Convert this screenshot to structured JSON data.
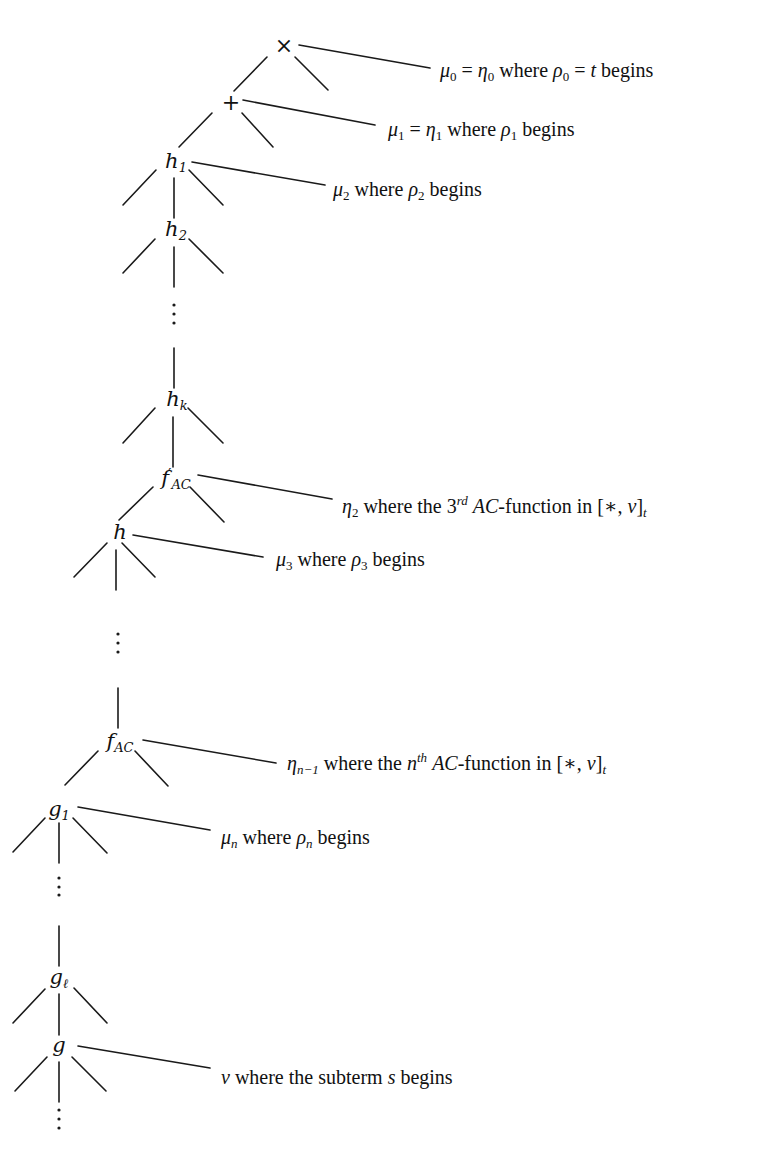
{
  "diagram": {
    "type": "term-tree-with-position-annotations",
    "nodes": [
      {
        "id": "times",
        "symbol": "×",
        "x": 284,
        "y": 46
      },
      {
        "id": "plus",
        "symbol": "+",
        "x": 231,
        "y": 103
      },
      {
        "id": "h1",
        "base": "h",
        "sub": "1",
        "x": 176,
        "y": 162
      },
      {
        "id": "h2",
        "base": "h",
        "sub": "2",
        "x": 176,
        "y": 230
      },
      {
        "id": "hk",
        "base": "h",
        "sub": "k",
        "x": 177,
        "y": 400
      },
      {
        "id": "f_prime_ac",
        "base": "f",
        "prime": "′",
        "sub": "AC",
        "x": 176,
        "y": 479
      },
      {
        "id": "h",
        "base": "h",
        "x": 120,
        "y": 532
      },
      {
        "id": "f_ac",
        "base": "f",
        "sub": "AC",
        "x": 120,
        "y": 742
      },
      {
        "id": "g1",
        "base": "g",
        "sub": "1",
        "x": 59,
        "y": 810
      },
      {
        "id": "g_l",
        "base": "g",
        "sub": "ℓ",
        "x": 59,
        "y": 978
      },
      {
        "id": "g",
        "base": "g",
        "x": 59,
        "y": 1045
      }
    ],
    "annotations": [
      {
        "id": "mu0",
        "parts": [
          {
            "t": "μ",
            "m": true
          },
          {
            "sub": "0"
          },
          {
            "t": " = "
          },
          {
            "t": "η",
            "m": true
          },
          {
            "sub": "0"
          },
          {
            "t": " where "
          },
          {
            "t": "ρ",
            "m": true
          },
          {
            "sub": "0"
          },
          {
            "t": " = "
          },
          {
            "t": "t",
            "m": true
          },
          {
            "t": " begins"
          }
        ],
        "text": "μ0 = η0 where ρ0 = t begins",
        "x": 440,
        "y": 60
      },
      {
        "id": "mu1",
        "parts": [
          {
            "t": "μ",
            "m": true
          },
          {
            "sub": "1"
          },
          {
            "t": " = "
          },
          {
            "t": "η",
            "m": true
          },
          {
            "sub": "1"
          },
          {
            "t": " where "
          },
          {
            "t": "ρ",
            "m": true
          },
          {
            "sub": "1"
          },
          {
            "t": " begins"
          }
        ],
        "text": "μ1 = η1 where ρ1 begins",
        "x": 388,
        "y": 119
      },
      {
        "id": "mu2",
        "parts": [
          {
            "t": "μ",
            "m": true
          },
          {
            "sub": "2"
          },
          {
            "t": " where "
          },
          {
            "t": "ρ",
            "m": true
          },
          {
            "sub": "2"
          },
          {
            "t": " begins"
          }
        ],
        "text": "μ2 where ρ2 begins",
        "x": 333,
        "y": 179
      },
      {
        "id": "eta2",
        "parts": [
          {
            "t": "η",
            "m": true
          },
          {
            "sub": "2"
          },
          {
            "t": " where the 3"
          },
          {
            "sup": "rd"
          },
          {
            "t": " "
          },
          {
            "t": "AC",
            "m": true
          },
          {
            "t": "-function in [∗, "
          },
          {
            "t": "ν",
            "m": true
          },
          {
            "t": "]"
          },
          {
            "sub": "t",
            "m": true
          }
        ],
        "text": "η2 where the 3rd AC-function in [∗,ν]t",
        "x": 342,
        "y": 494
      },
      {
        "id": "mu3",
        "parts": [
          {
            "t": "μ",
            "m": true
          },
          {
            "sub": "3"
          },
          {
            "t": " where "
          },
          {
            "t": "ρ",
            "m": true
          },
          {
            "sub": "3"
          },
          {
            "t": " begins"
          }
        ],
        "text": "μ3 where ρ3 begins",
        "x": 276,
        "y": 549
      },
      {
        "id": "eta_n_minus_1",
        "parts": [
          {
            "t": "η",
            "m": true
          },
          {
            "sub": "n−1",
            "m": true
          },
          {
            "t": " where the "
          },
          {
            "t": "n",
            "m": true
          },
          {
            "sup": "th"
          },
          {
            "t": " "
          },
          {
            "t": "AC",
            "m": true
          },
          {
            "t": "-function in [∗, "
          },
          {
            "t": "ν",
            "m": true
          },
          {
            "t": "]"
          },
          {
            "sub": "t",
            "m": true
          }
        ],
        "text": "ηn−1 where the nth AC-function in [∗,ν]t",
        "x": 287,
        "y": 751
      },
      {
        "id": "mu_n",
        "parts": [
          {
            "t": "μ",
            "m": true
          },
          {
            "sub": "n",
            "m": true
          },
          {
            "t": " where "
          },
          {
            "t": "ρ",
            "m": true
          },
          {
            "sub": "n",
            "m": true
          },
          {
            "t": " begins"
          }
        ],
        "text": "μn where ρn begins",
        "x": 221,
        "y": 827
      },
      {
        "id": "nu",
        "parts": [
          {
            "t": "ν",
            "m": true
          },
          {
            "t": " where the subterm "
          },
          {
            "t": "s",
            "m": true
          },
          {
            "t": " begins"
          }
        ],
        "text": "ν where the subterm s begins",
        "x": 221,
        "y": 1067
      }
    ],
    "edges": [
      [
        267,
        57,
        234,
        91
      ],
      [
        295,
        57,
        328,
        90
      ],
      [
        212,
        113,
        179,
        147
      ],
      [
        242,
        113,
        273,
        147
      ],
      [
        156,
        170,
        123,
        205
      ],
      [
        189,
        170,
        223,
        205
      ],
      [
        174,
        178,
        174,
        218
      ],
      [
        155,
        239,
        123,
        273
      ],
      [
        189,
        239,
        223,
        273
      ],
      [
        174,
        247,
        174,
        287
      ],
      [
        174,
        348,
        174,
        388
      ],
      [
        155,
        408,
        123,
        443
      ],
      [
        188,
        408,
        223,
        443
      ],
      [
        173,
        417,
        173,
        467
      ],
      [
        153,
        487,
        119,
        520
      ],
      [
        190,
        487,
        224,
        522
      ],
      [
        107,
        543,
        74,
        577
      ],
      [
        122,
        543,
        155,
        577
      ],
      [
        116,
        550,
        116,
        590
      ],
      [
        118,
        688,
        118,
        728
      ],
      [
        98,
        751,
        65,
        785
      ],
      [
        135,
        751,
        168,
        786
      ],
      [
        45,
        818,
        13,
        852
      ],
      [
        73,
        818,
        107,
        853
      ],
      [
        59,
        823,
        59,
        863
      ],
      [
        59,
        926,
        59,
        966
      ],
      [
        45,
        989,
        13,
        1023
      ],
      [
        74,
        988,
        107,
        1023
      ],
      [
        59,
        994,
        59,
        1035
      ],
      [
        47,
        1057,
        15,
        1091
      ],
      [
        72,
        1057,
        106,
        1091
      ],
      [
        59,
        1062,
        59,
        1102
      ]
    ],
    "pointers": [
      [
        299,
        45,
        430,
        68
      ],
      [
        243,
        100,
        375,
        125
      ],
      [
        192,
        162,
        325,
        185
      ],
      [
        198,
        475,
        332,
        499
      ],
      [
        133,
        535,
        263,
        557
      ],
      [
        143,
        740,
        276,
        763
      ],
      [
        78,
        807,
        210,
        830
      ],
      [
        78,
        1046,
        210,
        1068
      ]
    ],
    "ellipses": [
      {
        "x": 174,
        "ys": [
          305,
          314,
          323
        ]
      },
      {
        "x": 118,
        "ys": [
          634,
          643,
          652
        ]
      },
      {
        "x": 59,
        "ys": [
          878,
          887,
          895
        ]
      },
      {
        "x": 59,
        "ys": [
          1110,
          1119,
          1128
        ]
      }
    ]
  }
}
